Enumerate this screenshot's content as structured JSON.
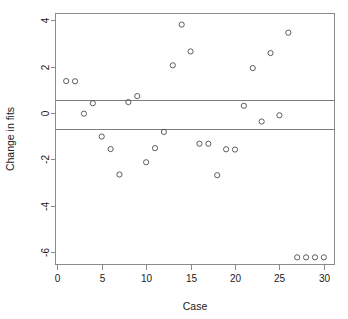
{
  "chart_data": {
    "type": "scatter",
    "title": "",
    "subtitle": "",
    "xlabel": "Case",
    "ylabel": "Change in fits",
    "xlim": [
      -0.2,
      31.2
    ],
    "ylim": [
      -6.55,
      4.3
    ],
    "xticks": [
      0,
      5,
      10,
      15,
      20,
      25,
      30
    ],
    "xtick_labels": [
      "0",
      "5",
      "10",
      "15",
      "20",
      "25",
      "30"
    ],
    "yticks": [
      4,
      2,
      0,
      -2,
      -4,
      -6
    ],
    "ytick_labels": [
      "4",
      "2",
      "0",
      "-2",
      "-4",
      "-6"
    ],
    "grid": false,
    "legend": null,
    "marker": "open-circle",
    "marker_color": "#4c4c4c",
    "frame_color": "#8a8a8a",
    "reference_lines": [
      {
        "name": "upper-threshold",
        "y": 0.58,
        "orientation": "horizontal",
        "color": "#7d7d7d"
      },
      {
        "name": "lower-threshold",
        "y": -0.7,
        "orientation": "horizontal",
        "color": "#7d7d7d"
      }
    ],
    "x": [
      1,
      2,
      3,
      4,
      5,
      6,
      7,
      8,
      9,
      10,
      11,
      12,
      13,
      14,
      15,
      16,
      17,
      18,
      19,
      20,
      21,
      22,
      23,
      24,
      25,
      26,
      27,
      28,
      29,
      30
    ],
    "y": [
      1.38,
      1.37,
      -0.03,
      0.42,
      -1.02,
      -1.56,
      -2.66,
      0.47,
      0.73,
      -2.13,
      -1.52,
      -0.82,
      2.06,
      3.82,
      2.66,
      -1.33,
      -1.33,
      -2.69,
      -1.57,
      -1.58,
      0.31,
      1.94,
      -0.37,
      2.59,
      -0.1,
      3.47,
      -6.24,
      -6.24,
      -6.24,
      -6.24
    ],
    "points": [
      {
        "case": 1,
        "change_in_fits": 1.38
      },
      {
        "case": 2,
        "change_in_fits": 1.37
      },
      {
        "case": 3,
        "change_in_fits": -0.03
      },
      {
        "case": 4,
        "change_in_fits": 0.42
      },
      {
        "case": 5,
        "change_in_fits": -1.02
      },
      {
        "case": 6,
        "change_in_fits": -1.56
      },
      {
        "case": 7,
        "change_in_fits": -2.66
      },
      {
        "case": 8,
        "change_in_fits": 0.47
      },
      {
        "case": 9,
        "change_in_fits": 0.73
      },
      {
        "case": 10,
        "change_in_fits": -2.13
      },
      {
        "case": 11,
        "change_in_fits": -1.52
      },
      {
        "case": 12,
        "change_in_fits": -0.82
      },
      {
        "case": 13,
        "change_in_fits": 2.06
      },
      {
        "case": 14,
        "change_in_fits": 3.82
      },
      {
        "case": 15,
        "change_in_fits": 2.66
      },
      {
        "case": 16,
        "change_in_fits": -1.33
      },
      {
        "case": 17,
        "change_in_fits": -1.33
      },
      {
        "case": 18,
        "change_in_fits": -2.69
      },
      {
        "case": 19,
        "change_in_fits": -1.57
      },
      {
        "case": 20,
        "change_in_fits": -1.58
      },
      {
        "case": 21,
        "change_in_fits": 0.31
      },
      {
        "case": 22,
        "change_in_fits": 1.94
      },
      {
        "case": 23,
        "change_in_fits": -0.37
      },
      {
        "case": 24,
        "change_in_fits": 2.59
      },
      {
        "case": 25,
        "change_in_fits": -0.1
      },
      {
        "case": 26,
        "change_in_fits": 3.47
      },
      {
        "case": 27,
        "change_in_fits": -6.24
      },
      {
        "case": 28,
        "change_in_fits": -6.24
      },
      {
        "case": 29,
        "change_in_fits": -6.24
      },
      {
        "case": 30,
        "change_in_fits": -6.24
      }
    ]
  }
}
